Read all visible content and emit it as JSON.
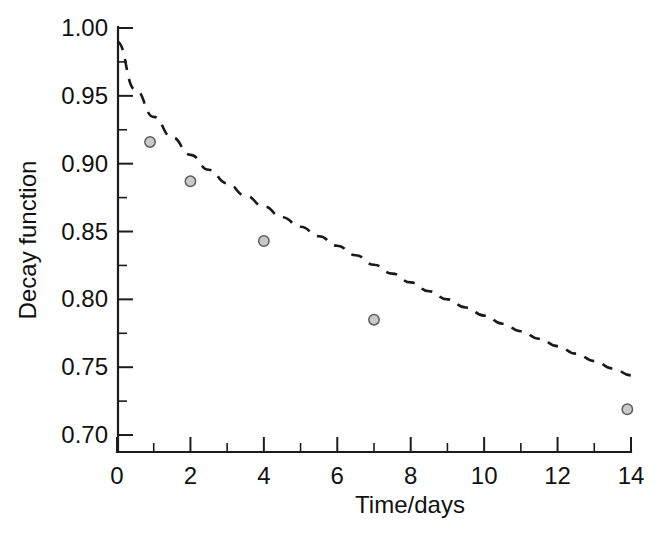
{
  "chart_data": {
    "type": "scatter",
    "title": "",
    "xlabel": "Time/days",
    "ylabel": "Decay function",
    "xlim": [
      0,
      14
    ],
    "ylim": [
      0.6875,
      1.0
    ],
    "grid": false,
    "legend": null,
    "x_ticks": [
      "0",
      "2",
      "4",
      "6",
      "8",
      "10",
      "12",
      "14"
    ],
    "x_tick_values": [
      0,
      2,
      4,
      6,
      8,
      10,
      12,
      14
    ],
    "x_minor_interval": 1,
    "y_ticks": [
      "0.70",
      "0.75",
      "0.80",
      "0.85",
      "0.90",
      "0.95",
      "1.00"
    ],
    "y_tick_values": [
      0.7,
      0.75,
      0.8,
      0.85,
      0.9,
      0.95,
      1.0
    ],
    "y_minor_interval": 0.025,
    "series": [
      {
        "name": "Measured decay",
        "style": "markers",
        "marker": "open-circle-grey",
        "x": [
          0.9,
          2.0,
          4.0,
          7.0,
          13.9
        ],
        "y": [
          0.916,
          0.887,
          0.843,
          0.785,
          0.719
        ]
      },
      {
        "name": "Exponential fit",
        "style": "dashed-line",
        "x": [
          0.0,
          0.5,
          1.0,
          1.5,
          2.0,
          2.5,
          3.0,
          3.5,
          4.0,
          4.5,
          5.0,
          5.5,
          6.0,
          6.5,
          7.0,
          7.5,
          8.0,
          8.5,
          9.0,
          9.5,
          10.0,
          10.5,
          11.0,
          11.5,
          12.0,
          12.5,
          13.0,
          13.5,
          14.0
        ],
        "y": [
          0.99,
          0.9545,
          0.9345,
          0.9195,
          0.9065,
          0.8955,
          0.8855,
          0.8765,
          0.8685,
          0.8605,
          0.8535,
          0.8465,
          0.8395,
          0.8325,
          0.8255,
          0.819,
          0.8125,
          0.806,
          0.8,
          0.794,
          0.788,
          0.782,
          0.7765,
          0.771,
          0.7655,
          0.76,
          0.7545,
          0.749,
          0.744
        ]
      }
    ]
  },
  "axes": {
    "y_axis_title": "Decay function",
    "x_axis_title": "Time/days"
  }
}
